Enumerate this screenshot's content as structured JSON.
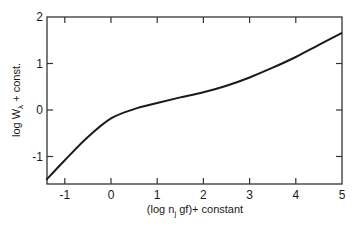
{
  "chart_data": {
    "type": "line",
    "title": "",
    "xlabel": "(log n_j gf)+ constant",
    "ylabel": "log W_λ + const.",
    "xlim": [
      -1.4,
      5
    ],
    "ylim": [
      -1.57,
      2
    ],
    "xticks": [
      -1,
      0,
      1,
      2,
      3,
      4,
      5
    ],
    "yticks": [
      -1,
      0,
      1,
      2
    ],
    "xtick_labels": [
      "-1",
      "0",
      "1",
      "2",
      "3",
      "4",
      "5"
    ],
    "ytick_labels": [
      "-1",
      "0",
      "1",
      "2"
    ],
    "grid": false,
    "legend": null,
    "series": [
      {
        "name": "curve of growth",
        "x": [
          -1.4,
          -1.0,
          -0.5,
          0.0,
          0.5,
          1.0,
          1.5,
          2.0,
          2.5,
          3.0,
          3.5,
          4.0,
          4.5,
          5.0
        ],
        "y": [
          -1.5,
          -1.08,
          -0.58,
          -0.18,
          0.02,
          0.15,
          0.27,
          0.38,
          0.52,
          0.7,
          0.91,
          1.14,
          1.4,
          1.66
        ]
      }
    ]
  },
  "labels": {
    "x_axis_main": "(log n",
    "x_axis_sub": "j",
    "x_axis_rest": " gf)+ constant",
    "y_axis_main": "log W",
    "y_axis_sub": "λ",
    "y_axis_rest": " + const."
  },
  "colors": {
    "line": "#1a1a1a",
    "axis": "#333333",
    "background": "#ffffff"
  }
}
